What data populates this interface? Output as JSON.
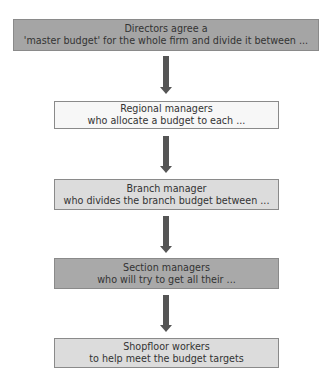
{
  "diagram": {
    "type": "flowchart",
    "direction": "top-to-bottom",
    "nodes": [
      {
        "id": "directors",
        "line1": "Directors agree a",
        "line2": "'master budget' for the whole firm and divide it between ...",
        "fill": "#a5a5a5"
      },
      {
        "id": "regional",
        "line1": "Regional managers",
        "line2": "who allocate a budget to each ...",
        "fill": "#f7f7f7"
      },
      {
        "id": "branch",
        "line1": "Branch manager",
        "line2": "who divides the branch budget between ...",
        "fill": "#dcdcdc"
      },
      {
        "id": "section",
        "line1": "Section managers",
        "line2": "who will try to get all their ...",
        "fill": "#a9a9a9"
      },
      {
        "id": "shopfloor",
        "line1": "Shopfloor workers",
        "line2": "to help meet the budget targets",
        "fill": "#dcdcdc"
      }
    ],
    "edges": [
      {
        "from": "directors",
        "to": "regional"
      },
      {
        "from": "regional",
        "to": "branch"
      },
      {
        "from": "branch",
        "to": "section"
      },
      {
        "from": "section",
        "to": "shopfloor"
      }
    ],
    "arrow_color": "#555555"
  }
}
